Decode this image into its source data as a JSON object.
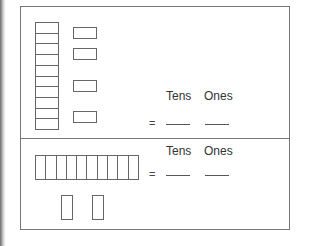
{
  "worksheet": {
    "problem1": {
      "tens_rods": 1,
      "rod_cells": 10,
      "ones_units": 4,
      "headers": {
        "tens": "Tens",
        "ones": "Ones"
      },
      "equals": "=",
      "answer_tens": "",
      "answer_ones": ""
    },
    "problem2": {
      "tens_rods": 1,
      "rod_cells": 10,
      "ones_units": 2,
      "headers": {
        "tens": "Tens",
        "ones": "Ones"
      },
      "equals": "=",
      "answer_tens": "",
      "answer_ones": ""
    }
  }
}
